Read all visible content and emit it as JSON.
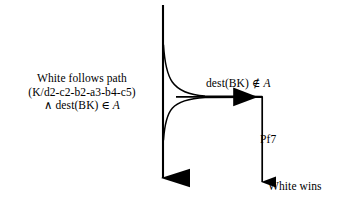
{
  "diagram": {
    "type": "flow-branch-diagram",
    "background_color": "#ffffff",
    "stroke_color": "#000000",
    "labels": {
      "left_condition": {
        "line1": "White follows path",
        "line2": "(K/d2-c2-b2-a3-b4-c5)",
        "line3_prefix": "∧ dest(BK) ",
        "line3_member": "∈",
        "line3_set": "A"
      },
      "branch_condition": {
        "prefix": "dest(BK) ",
        "member": "∉",
        "set": "A"
      },
      "move": "Pf7",
      "outcome": "White wins"
    },
    "edges": [
      {
        "name": "main-vertical-edge",
        "from": [
          163,
          5
        ],
        "to": [
          163,
          191
        ],
        "arrowhead": "filled-triangle-down"
      },
      {
        "name": "branch-curve-upper",
        "from": [
          163,
          45
        ],
        "to": [
          262,
          97
        ],
        "style": "curved"
      },
      {
        "name": "branch-curve-lower",
        "from": [
          163,
          140
        ],
        "to": [
          262,
          97
        ],
        "style": "curved"
      },
      {
        "name": "branch-horizontal-edge",
        "from": [
          180,
          97
        ],
        "to": [
          262,
          97
        ],
        "arrowhead": "filled-triangle-right"
      },
      {
        "name": "outcome-vertical-edge",
        "from": [
          262,
          97
        ],
        "to": [
          262,
          189
        ],
        "arrowhead": "filled-triangle-down-small"
      }
    ]
  }
}
